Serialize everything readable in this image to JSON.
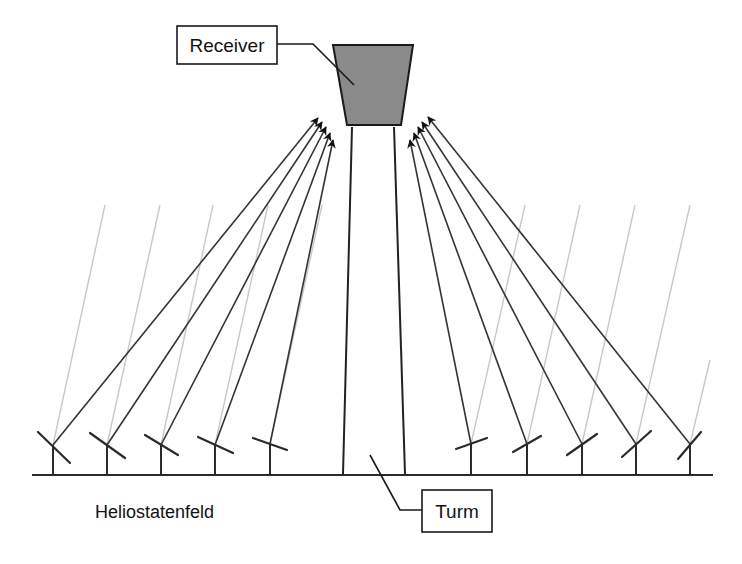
{
  "diagram": {
    "type": "solar-tower-power-plant",
    "labels": {
      "receiver": "Receiver",
      "tower": "Turm",
      "heliostat_field": "Heliostatenfeld"
    },
    "colors": {
      "receiver_fill": "#8a8a8a",
      "line": "#2a2a2a",
      "sun_ray": "#c8c8c8",
      "background": "#ffffff"
    },
    "receiver": {
      "top_left": [
        333,
        45
      ],
      "top_right": [
        413,
        45
      ],
      "bottom_right": [
        401,
        125
      ],
      "bottom_left": [
        347,
        125
      ]
    },
    "tower": {
      "left_wall": [
        [
          352,
          127
        ],
        [
          343,
          474
        ]
      ],
      "right_wall": [
        [
          394,
          127
        ],
        [
          405,
          474
        ]
      ]
    },
    "ground": {
      "y": 475,
      "x_start": 32,
      "x_end": 713
    },
    "heliostats": [
      {
        "side": "left",
        "pivot": [
          53,
          445
        ],
        "mirror": [
          [
            38,
            432
          ],
          [
            70,
            463
          ]
        ],
        "sun_from": [
          105,
          205
        ],
        "target": [
          318,
          118
        ]
      },
      {
        "side": "left",
        "pivot": [
          107,
          445
        ],
        "mirror": [
          [
            90,
            433
          ],
          [
            125,
            458
          ]
        ],
        "sun_from": [
          160,
          205
        ],
        "target": [
          322,
          122
        ]
      },
      {
        "side": "left",
        "pivot": [
          161,
          445
        ],
        "mirror": [
          [
            145,
            435
          ],
          [
            178,
            455
          ]
        ],
        "sun_from": [
          213,
          205
        ],
        "target": [
          326,
          127
        ]
      },
      {
        "side": "left",
        "pivot": [
          215,
          445
        ],
        "mirror": [
          [
            198,
            437
          ],
          [
            233,
            453
          ]
        ],
        "sun_from": [
          268,
          205
        ],
        "target": [
          330,
          133
        ]
      },
      {
        "side": "left",
        "pivot": [
          270,
          444
        ],
        "mirror": [
          [
            253,
            438
          ],
          [
            287,
            450
          ]
        ],
        "sun_from": [
          322,
          205
        ],
        "target": [
          333,
          140
        ]
      },
      {
        "side": "right",
        "pivot": [
          471,
          444
        ],
        "mirror": [
          [
            456,
            449
          ],
          [
            487,
            438
          ]
        ],
        "sun_from": [
          525,
          205
        ],
        "target": [
          410,
          140
        ]
      },
      {
        "side": "right",
        "pivot": [
          527,
          444
        ],
        "mirror": [
          [
            513,
            452
          ],
          [
            541,
            436
          ]
        ],
        "sun_from": [
          580,
          205
        ],
        "target": [
          414,
          133
        ]
      },
      {
        "side": "right",
        "pivot": [
          582,
          444
        ],
        "mirror": [
          [
            567,
            455
          ],
          [
            597,
            434
          ]
        ],
        "sun_from": [
          635,
          205
        ],
        "target": [
          418,
          127
        ]
      },
      {
        "side": "right",
        "pivot": [
          636,
          444
        ],
        "mirror": [
          [
            622,
            457
          ],
          [
            651,
            431
          ]
        ],
        "sun_from": [
          690,
          205
        ],
        "target": [
          422,
          122
        ]
      },
      {
        "side": "right",
        "pivot": [
          690,
          444
        ],
        "mirror": [
          [
            678,
            459
          ],
          [
            701,
            432
          ]
        ],
        "sun_from": [
          710,
          360
        ],
        "target": [
          428,
          117
        ]
      }
    ],
    "callouts": {
      "receiver_box": {
        "x": 177,
        "y": 26,
        "w": 100,
        "h": 38
      },
      "receiver_leader": [
        [
          277,
          44
        ],
        [
          313,
          44
        ],
        [
          354,
          85
        ]
      ],
      "tower_box": {
        "x": 422,
        "y": 490,
        "w": 70,
        "h": 42
      },
      "tower_leader": [
        [
          370,
          455
        ],
        [
          400,
          510
        ],
        [
          422,
          510
        ]
      ],
      "field_caption_pos": [
        95,
        518
      ]
    }
  }
}
